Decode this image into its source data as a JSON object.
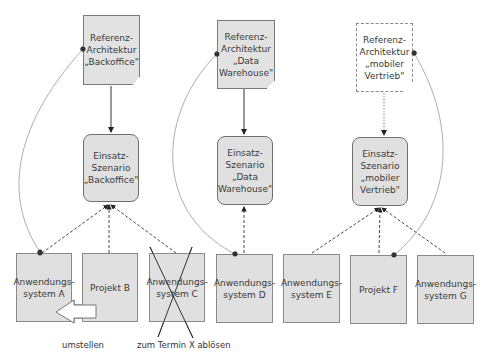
{
  "reference_architectures": [
    {
      "id": "ra_backoffice",
      "label": "Referenz-\nArchitektur\n„Backoffice\"",
      "style": "filled"
    },
    {
      "id": "ra_dw",
      "label": "Referenz-\nArchitektur\n„Data\nWarehouse\"",
      "style": "filled"
    },
    {
      "id": "ra_mobil",
      "label": "Referenz-\nArchitektur\n„mobiler\nVertrieb\"",
      "style": "white-dashed"
    }
  ],
  "scenarios": [
    {
      "id": "es_backoffice",
      "label": "Einsatz-\nSzenario\n„Backoffice\""
    },
    {
      "id": "es_dw",
      "label": "Einsatz-\nSzenario\n„Data\nWarehouse\""
    },
    {
      "id": "es_mobil",
      "label": "Einsatz-\nSzenario\n„mobiler\nVertrieb\""
    }
  ],
  "systems": [
    {
      "id": "sys_a",
      "label": "Anwendungs-\nsystem A"
    },
    {
      "id": "proj_b",
      "label": "Projekt B"
    },
    {
      "id": "sys_c",
      "label": "Anwendungs-\nsystem C",
      "crossed_out": true
    },
    {
      "id": "sys_d",
      "label": "Anwendungs-\nsystem D"
    },
    {
      "id": "sys_e",
      "label": "Anwendungs-\nsystem E"
    },
    {
      "id": "proj_f",
      "label": "Projekt F"
    },
    {
      "id": "sys_g",
      "label": "Anwendungs-\nsystem G"
    }
  ],
  "annotations": {
    "umstellen": "umstellen",
    "abloesen": "zum Termin X ablösen"
  },
  "colors": {
    "box_fill": "#e0e0e0",
    "box_border": "#7a7a7a",
    "edge": "#333333",
    "curve": "#999999"
  }
}
